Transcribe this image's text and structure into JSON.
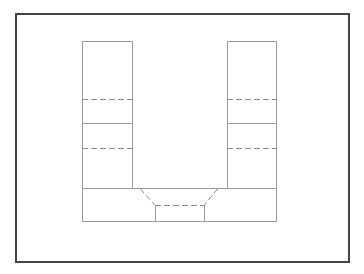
{
  "canvas": {
    "width": 364,
    "height": 274,
    "background": "#ffffff"
  },
  "frame": {
    "x": 16,
    "y": 14,
    "width": 333,
    "height": 248,
    "stroke": "#444444",
    "stroke_width": 2
  },
  "line_color": "#9a9a9a",
  "dash_color": "#8a8a8a",
  "drawing": {
    "description": "U-shaped planar line drawing with two vertical columns, a base rectangle and a dashed trapezoid recess",
    "left_column": {
      "x": 82,
      "y": 41,
      "width": 50,
      "height": 147,
      "dashed_lines_y": [
        99,
        148
      ],
      "solid_divider_y": 123
    },
    "right_column": {
      "x": 227,
      "y": 41,
      "width": 49,
      "height": 147,
      "dashed_lines_y": [
        99,
        148
      ],
      "solid_divider_y": 123
    },
    "base": {
      "x": 82,
      "y": 188,
      "width": 194,
      "height": 33
    },
    "recess": {
      "top_left_x": 140,
      "top_right_x": 218,
      "top_y": 188,
      "bottom_left_x": 155,
      "bottom_right_x": 204,
      "bottom_y": 205
    }
  }
}
